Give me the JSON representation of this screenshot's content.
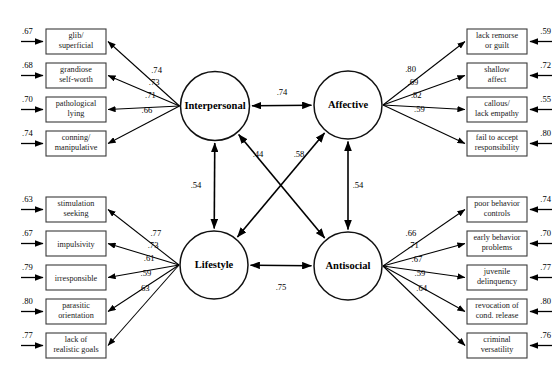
{
  "figure": {
    "type": "structural-equation-model",
    "background": "#ffffff",
    "line_color": "#000000",
    "box_stroke": "#3a3a3a"
  },
  "latent_factors": [
    {
      "id": "interpersonal",
      "label": "Interpersonal",
      "cx": 215,
      "cy": 106,
      "r": 34.5
    },
    {
      "id": "affective",
      "label": "Affective",
      "cx": 348,
      "cy": 105,
      "r": 34.0
    },
    {
      "id": "lifestyle",
      "label": "Lifestyle",
      "cx": 214,
      "cy": 265,
      "r": 34.0
    },
    {
      "id": "antisocial",
      "label": "Antisocial",
      "cx": 348,
      "cy": 266,
      "r": 34.0
    }
  ],
  "indicator_groups": [
    {
      "factor": "interpersonal",
      "side": "left",
      "indicators": [
        {
          "lines": [
            "glib/",
            "superficial"
          ],
          "loading": ".74",
          "residual": ".67",
          "box_y": 29
        },
        {
          "lines": [
            "grandiose",
            "self-worth"
          ],
          "loading": ".73",
          "residual": ".68",
          "box_y": 63
        },
        {
          "lines": [
            "pathological",
            "lying"
          ],
          "loading": ".71",
          "residual": ".70",
          "box_y": 97
        },
        {
          "lines": [
            "conning/",
            "manipulative"
          ],
          "loading": ".66",
          "residual": ".74",
          "box_y": 131
        }
      ]
    },
    {
      "factor": "affective",
      "side": "right",
      "indicators": [
        {
          "lines": [
            "lack remorse",
            "or guilt"
          ],
          "loading": ".80",
          "residual": ".59",
          "box_y": 29
        },
        {
          "lines": [
            "shallow",
            "affect"
          ],
          "loading": ".69",
          "residual": ".72",
          "box_y": 63
        },
        {
          "lines": [
            "callous/",
            "lack empathy"
          ],
          "loading": ".82",
          "residual": ".55",
          "box_y": 97
        },
        {
          "lines": [
            "fail to accept",
            "responsibility"
          ],
          "loading": ".59",
          "residual": ".80",
          "box_y": 131
        }
      ]
    },
    {
      "factor": "lifestyle",
      "side": "left",
      "indicators": [
        {
          "lines": [
            "stimulation",
            "seeking"
          ],
          "loading": ".77",
          "residual": ".63",
          "box_y": 197
        },
        {
          "lines": [
            "impulsivity"
          ],
          "loading": ".73",
          "residual": ".67",
          "box_y": 231
        },
        {
          "lines": [
            "irresponsible"
          ],
          "loading": ".61",
          "residual": ".79",
          "box_y": 265
        },
        {
          "lines": [
            "parasitic",
            "orientation"
          ],
          "loading": ".59",
          "residual": ".80",
          "box_y": 299
        },
        {
          "lines": [
            "lack of",
            "realistic goals"
          ],
          "loading": ".63",
          "residual": ".77",
          "box_y": 333
        }
      ]
    },
    {
      "factor": "antisocial",
      "side": "right",
      "indicators": [
        {
          "lines": [
            "poor behavior",
            "controls"
          ],
          "loading": ".66",
          "residual": ".74",
          "box_y": 197
        },
        {
          "lines": [
            "early behavior",
            "problems"
          ],
          "loading": ".71",
          "residual": ".70",
          "box_y": 231
        },
        {
          "lines": [
            "juvenile",
            "delinquency"
          ],
          "loading": ".67",
          "residual": ".77",
          "box_y": 265
        },
        {
          "lines": [
            "revocation of",
            "cond. release"
          ],
          "loading": ".59",
          "residual": ".80",
          "box_y": 299
        },
        {
          "lines": [
            "criminal",
            "versatility"
          ],
          "loading": ".64",
          "residual": ".76",
          "box_y": 333
        }
      ]
    }
  ],
  "factor_correlations": [
    {
      "id": "interpersonal-affective",
      "from": "interpersonal",
      "to": "affective",
      "value": ".74",
      "label_x": 282,
      "label_y": 95,
      "orientation": "horizontal-top"
    },
    {
      "id": "lifestyle-antisocial",
      "from": "lifestyle",
      "to": "antisocial",
      "value": ".75",
      "label_x": 281,
      "label_y": 290,
      "orientation": "horizontal-bottom"
    },
    {
      "id": "interpersonal-lifestyle",
      "from": "interpersonal",
      "to": "lifestyle",
      "value": ".54",
      "label_x": 196,
      "label_y": 188,
      "orientation": "vertical-left"
    },
    {
      "id": "affective-antisocial",
      "from": "affective",
      "to": "antisocial",
      "value": ".54",
      "label_x": 358,
      "label_y": 188,
      "orientation": "vertical-right"
    },
    {
      "id": "interpersonal-antisocial",
      "from": "antisocial",
      "to": "interpersonal",
      "value": ".44",
      "label_x": 258,
      "label_y": 157,
      "orientation": "diagonal-nw"
    },
    {
      "id": "affective-lifestyle",
      "from": "lifestyle",
      "to": "affective",
      "value": ".58",
      "label_x": 299,
      "label_y": 157,
      "orientation": "diagonal-ne"
    }
  ]
}
